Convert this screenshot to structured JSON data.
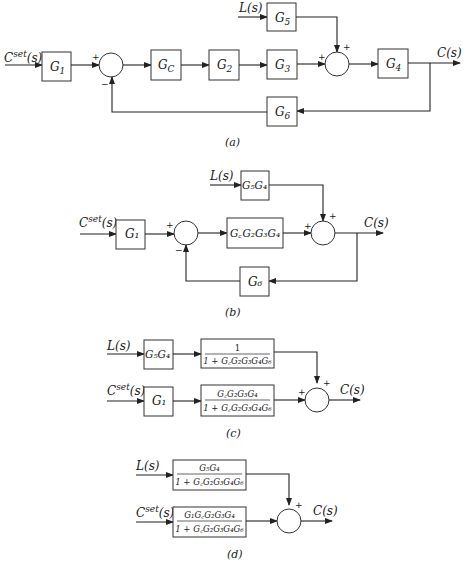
{
  "diagrams": {
    "a": {
      "caption": "(a)",
      "inputs": {
        "setpoint": "C",
        "setpoint_sup": "set",
        "setpoint_arg": "(s)",
        "load": "L(s)"
      },
      "output": "C(s)",
      "blocks": {
        "g1": "G",
        "g1_sub": "1",
        "gc": "G",
        "gc_sub": "C",
        "g2": "G",
        "g2_sub": "2",
        "g3": "G",
        "g3_sub": "3",
        "g4": "G",
        "g4_sub": "4",
        "g5": "G",
        "g5_sub": "5",
        "g6": "G",
        "g6_sub": "6"
      },
      "signs": {
        "sum1_top": "+",
        "sum1_bottom": "−",
        "sum2_left": "+",
        "sum2_top": "+"
      }
    },
    "b": {
      "caption": "(b)",
      "inputs": {
        "setpoint": "C",
        "setpoint_sup": "set",
        "setpoint_arg": "(s)",
        "load": "L(s)"
      },
      "output": "C(s)",
      "blocks": {
        "g1": "G₁",
        "g5g4": "G₅G₄",
        "forward": "G꜀G₂G₃G₄",
        "g6": "G₆"
      },
      "signs": {
        "sum1_top": "+",
        "sum1_bottom": "−",
        "sum2_left": "+",
        "sum2_top": "+"
      }
    },
    "c": {
      "caption": "(c)",
      "inputs": {
        "setpoint": "C",
        "setpoint_sup": "set",
        "setpoint_arg": "(s)",
        "load": "L(s)"
      },
      "output": "C(s)",
      "blocks": {
        "g5g4": "G₅G₄",
        "g1": "G₁",
        "load_tf_num": "1",
        "load_tf_den": "1 + G꜀G₂G₃G₄G₆",
        "sp_tf_num": "G꜀G₂G₃G₄",
        "sp_tf_den": "1 + G꜀G₂G₃G₄G₆"
      },
      "signs": {
        "sum_left": "+",
        "sum_top": "+"
      }
    },
    "d": {
      "caption": "(d)",
      "inputs": {
        "setpoint": "C",
        "setpoint_sup": "set",
        "setpoint_arg": "(s)",
        "load": "L(s)"
      },
      "output": "C(s)",
      "blocks": {
        "load_tf_num": "G₅G₄",
        "load_tf_den": "1 + G꜀G₂G₃G₄G₆",
        "sp_tf_num": "G₁G꜀G₂G₃G₄",
        "sp_tf_den": "1 + G꜀G₂G₃G₄G₆"
      },
      "signs": {
        "sum_top": "+"
      }
    }
  },
  "colors": {
    "line": "#222222",
    "background": "#ffffff"
  }
}
